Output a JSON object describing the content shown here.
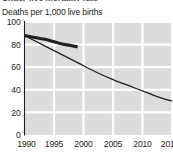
{
  "chart_data": {
    "type": "line",
    "title": "Under-five mortality rate",
    "subtitle": "Deaths per 1,000 live births",
    "xlabel": "",
    "ylabel": "Deaths per 1,000 live births",
    "xlim": [
      1990,
      2015
    ],
    "ylim": [
      0,
      100
    ],
    "grid": true,
    "legend_position": "none",
    "xticks": [
      1990,
      1995,
      2000,
      2005,
      2010,
      2015
    ],
    "xticklabels": [
      "1990",
      "1995",
      "2000",
      "2005",
      "2010",
      "2015"
    ],
    "yticks": [
      0,
      20,
      40,
      60,
      80,
      100
    ],
    "yticklabels": [
      "0",
      "20",
      "40",
      "60",
      "80",
      "100"
    ],
    "series": [
      {
        "name": "observed-trend",
        "style": "thick",
        "color": "#231f20",
        "width": 3.1,
        "x": [
          1990,
          1992,
          1994,
          1996,
          1998,
          1999
        ],
        "values": [
          88,
          86,
          84,
          81,
          79,
          78
        ]
      },
      {
        "name": "projected-decline",
        "style": "thin",
        "color": "#231f20",
        "width": 1.25,
        "x": [
          1990,
          1993,
          1996,
          1999,
          2002,
          2005,
          2008,
          2011,
          2013,
          2015
        ],
        "values": [
          88,
          80,
          72,
          64,
          56,
          49,
          43,
          37,
          33,
          30
        ]
      }
    ]
  },
  "axis": {
    "y_axis_line_color": "#231f20",
    "plot_background": "#dcdcdc",
    "gridline_color": "#ffffff"
  }
}
